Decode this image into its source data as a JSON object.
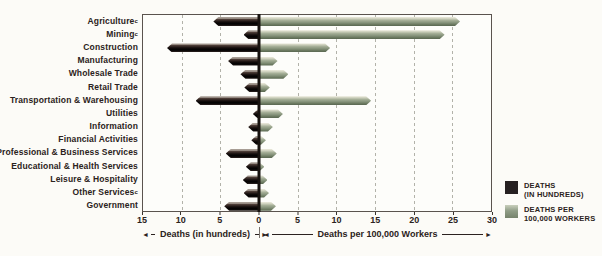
{
  "chart_data": {
    "type": "bar",
    "title": "",
    "orientation": "horizontal-diverging",
    "axis": {
      "range": [
        -15,
        30
      ],
      "zero_position_pct": 33.333,
      "ticks": [
        -15,
        -10,
        -5,
        0,
        5,
        10,
        15,
        20,
        25,
        30
      ],
      "gridlines": [
        -10,
        -5,
        5,
        10,
        15,
        20,
        25
      ],
      "left_axis_label": "Deaths (in hundreds)",
      "right_axis_label": "Deaths per 100,000 Workers",
      "grid_style": "dashed"
    },
    "series": [
      {
        "name": "DEATHS (IN HUNDREDS)",
        "key": "deaths_hundreds",
        "color": "#262021",
        "direction": "left"
      },
      {
        "name": "DEATHS PER 100,000 WORKERS",
        "key": "rate_per_100k",
        "color": "#909d87",
        "direction": "right"
      }
    ],
    "categories": [
      {
        "label": "Agriculture",
        "sup": "c",
        "deaths_hundreds": 5.9,
        "rate_per_100k": 26.0
      },
      {
        "label": "Mining",
        "sup": "c",
        "deaths_hundreds": 2.0,
        "rate_per_100k": 24.0
      },
      {
        "label": "Construction",
        "sup": "",
        "deaths_hundreds": 11.9,
        "rate_per_100k": 9.2
      },
      {
        "label": "Manufacturing",
        "sup": "",
        "deaths_hundreds": 4.0,
        "rate_per_100k": 2.4
      },
      {
        "label": "Wholesale Trade",
        "sup": "",
        "deaths_hundreds": 2.4,
        "rate_per_100k": 3.8
      },
      {
        "label": "Retail Trade",
        "sup": "",
        "deaths_hundreds": 1.9,
        "rate_per_100k": 1.4
      },
      {
        "label": "Transportation & Warehousing",
        "sup": "",
        "deaths_hundreds": 8.2,
        "rate_per_100k": 14.5
      },
      {
        "label": "Utilities",
        "sup": "",
        "deaths_hundreds": 0.8,
        "rate_per_100k": 3.1
      },
      {
        "label": "Information",
        "sup": "",
        "deaths_hundreds": 1.4,
        "rate_per_100k": 1.8
      },
      {
        "label": "Financial Activities",
        "sup": "",
        "deaths_hundreds": 1.0,
        "rate_per_100k": 0.9
      },
      {
        "label": "Professional & Business Services",
        "sup": "",
        "deaths_hundreds": 4.3,
        "rate_per_100k": 2.3
      },
      {
        "label": "Educational & Health Services",
        "sup": "",
        "deaths_hundreds": 1.7,
        "rate_per_100k": 0.7
      },
      {
        "label": "Leisure & Hospitality",
        "sup": "",
        "deaths_hundreds": 2.1,
        "rate_per_100k": 1.1
      },
      {
        "label": "Other Services",
        "sup": "c",
        "deaths_hundreds": 2.0,
        "rate_per_100k": 1.3
      },
      {
        "label": "Government",
        "sup": "",
        "deaths_hundreds": 4.5,
        "rate_per_100k": 2.2
      }
    ]
  },
  "axis_captions": {
    "left": "Deaths (in hundreds)",
    "right": "Deaths per 100,000 Workers",
    "left_arrow": "◄",
    "right_arrow": "►"
  },
  "legend": {
    "items": [
      {
        "line1": "DEATHS",
        "line2": "(IN HUNDREDS)",
        "color": "#262021"
      },
      {
        "line1": "DEATHS PER",
        "line2": "100,000 WORKERS",
        "color": "#909d87"
      }
    ]
  }
}
